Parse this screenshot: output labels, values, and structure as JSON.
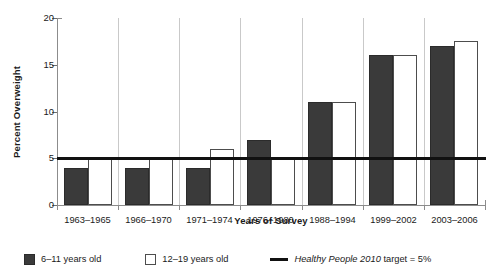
{
  "chart_data": {
    "type": "bar",
    "title": "",
    "xlabel": "Years of Survey",
    "ylabel": "Percent Overweight",
    "categories": [
      "1963–1965",
      "1966–1970",
      "1971–1974",
      "1976–1980",
      "1988–1994",
      "1999–2002",
      "2003–2006"
    ],
    "series": [
      {
        "name": "6–11 years old",
        "color": "#3a3a3a",
        "values": [
          4,
          4,
          4,
          7,
          11,
          16,
          17
        ]
      },
      {
        "name": "12–19 years old",
        "color": "#ffffff",
        "values": [
          5,
          5,
          6,
          5,
          11,
          16,
          17.5
        ]
      }
    ],
    "ylim": [
      0,
      20
    ],
    "yticks": [
      0,
      5,
      10,
      15,
      20
    ],
    "ytick_labels": [
      "0",
      "5",
      "10",
      "15",
      "20"
    ],
    "grid": false,
    "legend_position": "bottom",
    "reference_line": {
      "value": 5,
      "label_italic": "Healthy People 2010",
      "label_rest": " target = 5%",
      "color": "#111111"
    }
  },
  "legend": {
    "items": [
      {
        "label": "6–11 years old",
        "marker": "filled-square-swatch"
      },
      {
        "label": "12–19 years old",
        "marker": "open-square-swatch"
      },
      {
        "label_italic": "Healthy People 2010",
        "label_rest": " target = 5%",
        "marker": "line-swatch"
      }
    ]
  }
}
